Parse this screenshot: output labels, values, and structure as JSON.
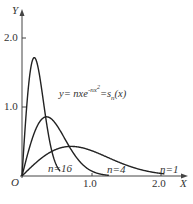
{
  "chart_data": {
    "type": "line",
    "title": "",
    "formula": "y= nxe^{-nx^2}=s_n(x)",
    "formula_parts": {
      "lhs": "y= nxe",
      "exp": "-nx",
      "exp_sup": "2",
      "rhs": "=s",
      "sub": "n",
      "tail": "(x)"
    },
    "xlabel": "X",
    "ylabel": "Y",
    "origin_label": "O",
    "xticks": [
      "1.0",
      "2.0"
    ],
    "yticks": [
      "1.0",
      "2.0"
    ],
    "xlim": [
      0,
      2.2
    ],
    "ylim": [
      0,
      2.2
    ],
    "grid": false,
    "series": [
      {
        "name": "n=1",
        "n": 1,
        "label": "n=1",
        "peak": [
          0.707,
          0.429
        ]
      },
      {
        "name": "n=4",
        "n": 4,
        "label": "n=4",
        "peak": [
          0.354,
          0.858
        ]
      },
      {
        "name": "n=16",
        "n": 16,
        "label": "n=16",
        "peak": [
          0.177,
          1.716
        ]
      }
    ]
  }
}
